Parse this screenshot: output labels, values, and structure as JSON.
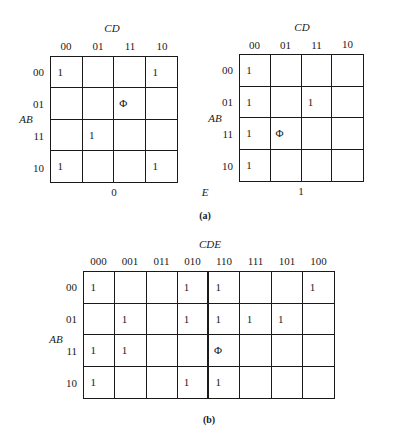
{
  "figure_a": {
    "caption": "(a)",
    "e_label": "E",
    "maps": [
      {
        "e_value": "0",
        "col_var": "CD",
        "row_var": "AB",
        "cols": [
          "00",
          "01",
          "11",
          "10"
        ],
        "rows": [
          "00",
          "01",
          "11",
          "10"
        ],
        "cells": [
          [
            "1",
            "",
            "",
            "1"
          ],
          [
            "",
            "",
            "Φ",
            ""
          ],
          [
            "",
            "1",
            "",
            ""
          ],
          [
            "1",
            "",
            "",
            "1"
          ]
        ]
      },
      {
        "e_value": "1",
        "col_var": "CD",
        "row_var": "AB",
        "cols": [
          "00",
          "01",
          "11",
          "10"
        ],
        "rows": [
          "00",
          "01",
          "11",
          "10"
        ],
        "cells": [
          [
            "1",
            "",
            "",
            ""
          ],
          [
            "1",
            "",
            "1",
            ""
          ],
          [
            "1",
            "Φ",
            "",
            ""
          ],
          [
            "1",
            "",
            "",
            ""
          ]
        ]
      }
    ]
  },
  "figure_b": {
    "caption": "(b)",
    "col_var": "CDE",
    "row_var": "AB",
    "cols": [
      "000",
      "001",
      "011",
      "010",
      "110",
      "111",
      "101",
      "100"
    ],
    "rows": [
      "00",
      "01",
      "11",
      "10"
    ],
    "cells": [
      [
        "1",
        "",
        "",
        "1",
        "1",
        "",
        "",
        "1"
      ],
      [
        "",
        "1",
        "",
        "1",
        "1",
        "1",
        "1",
        ""
      ],
      [
        "1",
        "1",
        "",
        "",
        "Φ",
        "",
        "",
        ""
      ],
      [
        "1",
        "",
        "",
        "1",
        "1",
        "",
        "",
        ""
      ]
    ]
  }
}
